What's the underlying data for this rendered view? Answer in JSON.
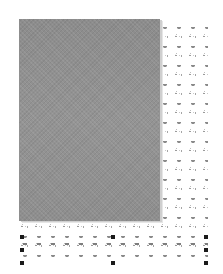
{
  "canvas": {
    "background": "#ffffff",
    "pattern_fill": {
      "description": "repeating leaf and swirl motif",
      "color": "#8a8a8a"
    },
    "image_block": {
      "fill": "#8f8f8f",
      "description": "gray textured rectangle"
    },
    "selection": {
      "handle_color": "#1a1a1a",
      "handles": [
        {
          "id": "top-left",
          "x": 20,
          "y": 235
        },
        {
          "id": "top-center",
          "x": 111,
          "y": 235
        },
        {
          "id": "top-right",
          "x": 204,
          "y": 235
        },
        {
          "id": "middle-left",
          "x": 20,
          "y": 248
        },
        {
          "id": "middle-right",
          "x": 204,
          "y": 248
        },
        {
          "id": "bottom-left",
          "x": 20,
          "y": 261
        },
        {
          "id": "bottom-center",
          "x": 111,
          "y": 261
        },
        {
          "id": "bottom-right",
          "x": 204,
          "y": 261
        }
      ]
    }
  }
}
